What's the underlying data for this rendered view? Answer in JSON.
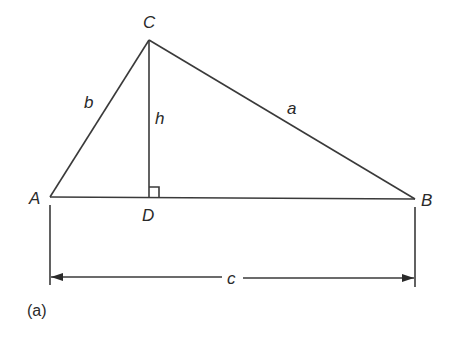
{
  "diagram": {
    "caption": "(a)",
    "vertices": {
      "A": {
        "label": "A"
      },
      "B": {
        "label": "B"
      },
      "C": {
        "label": "C"
      },
      "D": {
        "label": "D"
      }
    },
    "sides": {
      "a": {
        "label": "a"
      },
      "b": {
        "label": "b"
      },
      "c": {
        "label": "c"
      },
      "h": {
        "label": "h"
      }
    },
    "colors": {
      "stroke": "#3a3a3a",
      "text": "#2a2a2a",
      "background": "#ffffff"
    }
  }
}
